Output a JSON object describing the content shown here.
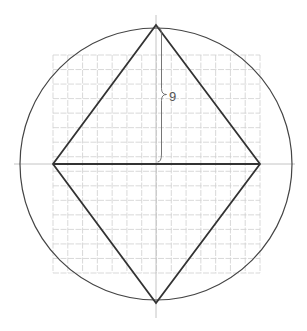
{
  "diagram": {
    "title": "",
    "center": [
      156,
      164
    ],
    "circle_radius": 136,
    "rhombus": {
      "vertices": [
        [
          156,
          25
        ],
        [
          260,
          164
        ],
        [
          156,
          303
        ],
        [
          53,
          164
        ]
      ]
    },
    "grid": {
      "x_min": 53,
      "x_max": 260,
      "y_min": 55,
      "y_max": 273,
      "spacing": 15
    },
    "axes": {
      "horizontal": [
        14,
        295
      ],
      "vertical": [
        15,
        318
      ]
    },
    "annotation": {
      "label": "9",
      "description": "brace marking half of the vertical diagonal"
    },
    "colors": {
      "grid": "#cfcfcf",
      "shape": "#333333",
      "circle": "#444444"
    }
  }
}
